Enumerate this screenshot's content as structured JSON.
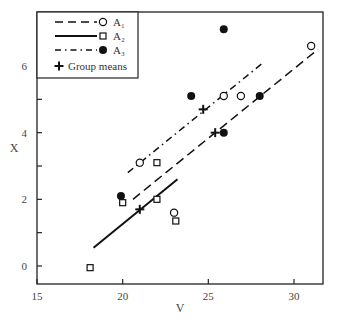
{
  "chart_data": {
    "type": "scatter",
    "title": "",
    "xlabel": "V",
    "ylabel": "X",
    "xlim": [
      15,
      31.7
    ],
    "ylim": [
      -0.55,
      7.6
    ],
    "xticks": [
      15,
      20,
      25,
      30
    ],
    "yticks": [
      0,
      2,
      4,
      6
    ],
    "grid": false,
    "legend_position": "upper left",
    "legend": [
      {
        "label": "A₁",
        "line": "dashed",
        "marker": "open-circle"
      },
      {
        "label": "A₂",
        "line": "solid",
        "marker": "open-square"
      },
      {
        "label": "A₃",
        "line": "dash-dot",
        "marker": "filled-circle"
      },
      {
        "label": "Group means",
        "line": "none",
        "marker": "plus"
      }
    ],
    "series": [
      {
        "name": "A₁",
        "marker": "open-circle",
        "points": [
          [
            21.0,
            3.1
          ],
          [
            23.0,
            1.6
          ],
          [
            25.9,
            5.1
          ],
          [
            26.9,
            5.1
          ],
          [
            31.0,
            6.6
          ]
        ],
        "fit_line": [
          [
            20.6,
            2.0
          ],
          [
            31.4,
            6.5
          ]
        ],
        "line_style": "dashed"
      },
      {
        "name": "A₂",
        "marker": "open-square",
        "points": [
          [
            18.1,
            -0.05
          ],
          [
            20.0,
            1.9
          ],
          [
            22.0,
            2.0
          ],
          [
            22.0,
            3.1
          ],
          [
            23.1,
            1.35
          ]
        ],
        "fit_line": [
          [
            18.3,
            0.55
          ],
          [
            23.2,
            2.6
          ]
        ],
        "line_style": "solid"
      },
      {
        "name": "A₃",
        "marker": "filled-circle",
        "points": [
          [
            19.9,
            2.1
          ],
          [
            24.0,
            5.1
          ],
          [
            25.9,
            4.0
          ],
          [
            25.9,
            7.1
          ],
          [
            28.0,
            5.1
          ]
        ],
        "fit_line": [
          [
            20.3,
            2.8
          ],
          [
            28.2,
            6.1
          ]
        ],
        "line_style": "dash-dot"
      },
      {
        "name": "Group means",
        "marker": "plus",
        "points": [
          [
            21.0,
            1.7
          ],
          [
            24.7,
            4.7
          ],
          [
            25.4,
            4.0
          ]
        ]
      }
    ]
  }
}
